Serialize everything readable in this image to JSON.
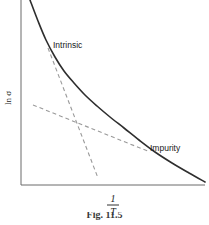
{
  "figure": {
    "background_color": "#ffffff",
    "axis_color": "#6b6b6b",
    "curve_color": "#2e2e2e",
    "dash_color": "#9a9a9a"
  },
  "axes": {
    "y_label": "ln σ",
    "x_label_numerator": "1",
    "x_label_denominator": "T",
    "x_label_plain": "1/T",
    "x_axis_min_px": 21,
    "x_axis_max_px": 205,
    "y_axis_top_px": 0,
    "y_axis_bottom_px": 185
  },
  "annotations": [
    {
      "name": "intrinsic",
      "label": "Intrinsic",
      "x": 53,
      "y": 45
    },
    {
      "name": "impurity",
      "label": "Impurity",
      "x": 150,
      "y": 148
    }
  ],
  "caption": {
    "text": "Fig. 11.5"
  },
  "chart_data": {
    "type": "line",
    "title": "",
    "subtitle": "",
    "xlabel": "1/T",
    "ylabel": "ln σ",
    "grid": false,
    "legend": "none",
    "axis_ticks": {
      "x": [],
      "y": []
    },
    "series": [
      {
        "name": "conductivity-curve",
        "style": "solid",
        "color": "#2e2e2e",
        "points_px": [
          [
            30,
            0
          ],
          [
            38,
            21
          ],
          [
            46,
            40
          ],
          [
            55,
            57
          ],
          [
            64,
            71
          ],
          [
            74,
            83
          ],
          [
            85,
            95
          ],
          [
            97,
            106
          ],
          [
            110,
            117
          ],
          [
            124,
            128
          ],
          [
            139,
            140
          ],
          [
            155,
            152
          ],
          [
            172,
            163
          ],
          [
            189,
            173
          ],
          [
            205,
            182
          ]
        ]
      },
      {
        "name": "intrinsic-asymptote",
        "style": "dashed",
        "color": "#9a9a9a",
        "points_px": [
          [
            48,
            48
          ],
          [
            98,
            178
          ]
        ]
      },
      {
        "name": "impurity-asymptote",
        "style": "dashed",
        "color": "#9a9a9a",
        "points_px": [
          [
            33,
            105
          ],
          [
            150,
            152
          ]
        ]
      }
    ]
  }
}
